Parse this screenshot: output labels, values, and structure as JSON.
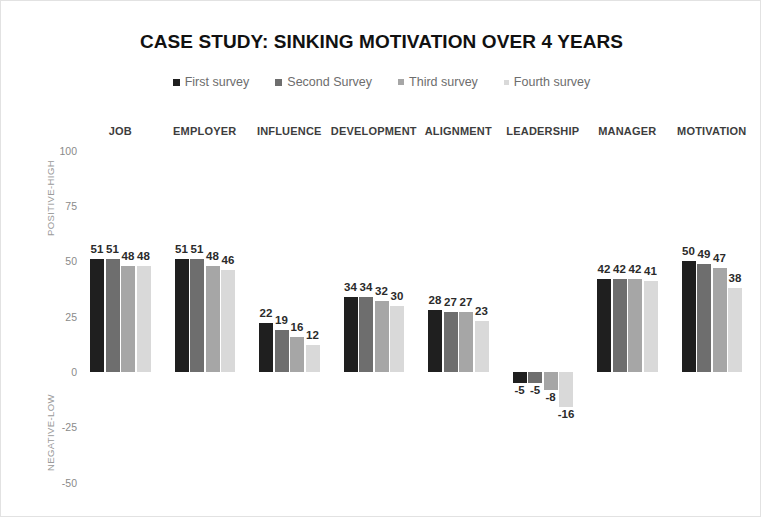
{
  "chart_data": {
    "type": "bar",
    "title": "CASE STUDY: SINKING MOTIVATION OVER 4 YEARS",
    "xlabel": "",
    "ylabel": "",
    "ylim": [
      -50,
      100
    ],
    "yticks": [
      100,
      75,
      50,
      25,
      0,
      -25,
      -50
    ],
    "grid": false,
    "legend_position": "top",
    "axis_annotations": {
      "top": "POSITIVE-HIGH",
      "bottom": "NEGATIVE-LOW"
    },
    "categories": [
      "JOB",
      "EMPLOYER",
      "INFLUENCE",
      "DEVELOPMENT",
      "ALIGNMENT",
      "LEADERSHIP",
      "MANAGER",
      "MOTIVATION"
    ],
    "series": [
      {
        "name": "First survey",
        "color": "#1f1f1f",
        "values": [
          51,
          51,
          22,
          34,
          28,
          -5,
          42,
          50
        ]
      },
      {
        "name": "Second Survey",
        "color": "#6e6e6e",
        "values": [
          51,
          51,
          19,
          34,
          27,
          -5,
          42,
          49
        ]
      },
      {
        "name": "Third survey",
        "color": "#a6a6a6",
        "values": [
          48,
          48,
          16,
          32,
          27,
          -8,
          42,
          47
        ]
      },
      {
        "name": "Fourth survey",
        "color": "#d9d9d9",
        "values": [
          48,
          46,
          12,
          30,
          23,
          -16,
          41,
          38
        ]
      }
    ]
  },
  "frame": {
    "border_color": "#e2e2e2",
    "background": "#ffffff"
  }
}
